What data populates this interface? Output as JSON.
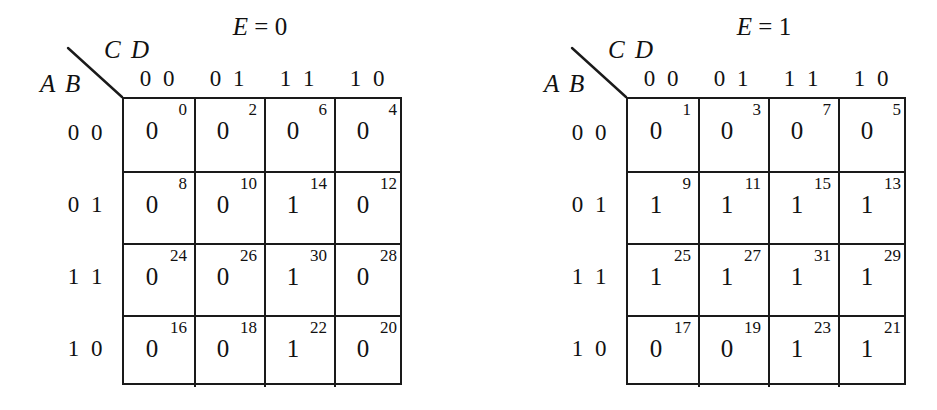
{
  "figure": {
    "type": "karnaugh-map-pair",
    "variables": [
      "A",
      "B",
      "C",
      "D",
      "E"
    ],
    "row_var_label": "A B",
    "col_var_label": "C D",
    "col_headers": [
      "0 0",
      "0 1",
      "1 1",
      "1 0"
    ],
    "row_headers": [
      "0 0",
      "0 1",
      "1 1",
      "1 0"
    ],
    "ink_color": "#1a1a1a",
    "background_color": "#ffffff"
  },
  "maps": [
    {
      "id": "map-e0",
      "title_var": "E",
      "title_rest": " = 0",
      "title_text": "E = 0",
      "e_value": "0",
      "rows": [
        {
          "label": "0 0",
          "cells": [
            {
              "index": "0",
              "value": "0"
            },
            {
              "index": "2",
              "value": "0"
            },
            {
              "index": "6",
              "value": "0"
            },
            {
              "index": "4",
              "value": "0"
            }
          ]
        },
        {
          "label": "0 1",
          "cells": [
            {
              "index": "8",
              "value": "0"
            },
            {
              "index": "10",
              "value": "0"
            },
            {
              "index": "14",
              "value": "1"
            },
            {
              "index": "12",
              "value": "0"
            }
          ]
        },
        {
          "label": "1 1",
          "cells": [
            {
              "index": "24",
              "value": "0"
            },
            {
              "index": "26",
              "value": "0"
            },
            {
              "index": "30",
              "value": "1"
            },
            {
              "index": "28",
              "value": "0"
            }
          ]
        },
        {
          "label": "1 0",
          "cells": [
            {
              "index": "16",
              "value": "0"
            },
            {
              "index": "18",
              "value": "0"
            },
            {
              "index": "22",
              "value": "1"
            },
            {
              "index": "20",
              "value": "0"
            }
          ]
        }
      ]
    },
    {
      "id": "map-e1",
      "title_var": "E",
      "title_rest": " = 1",
      "title_text": "E = 1",
      "e_value": "1",
      "rows": [
        {
          "label": "0 0",
          "cells": [
            {
              "index": "1",
              "value": "0"
            },
            {
              "index": "3",
              "value": "0"
            },
            {
              "index": "7",
              "value": "0"
            },
            {
              "index": "5",
              "value": "0"
            }
          ]
        },
        {
          "label": "0 1",
          "cells": [
            {
              "index": "9",
              "value": "1"
            },
            {
              "index": "11",
              "value": "1"
            },
            {
              "index": "15",
              "value": "1"
            },
            {
              "index": "13",
              "value": "1"
            }
          ]
        },
        {
          "label": "1 1",
          "cells": [
            {
              "index": "25",
              "value": "1"
            },
            {
              "index": "27",
              "value": "1"
            },
            {
              "index": "31",
              "value": "1"
            },
            {
              "index": "29",
              "value": "1"
            }
          ]
        },
        {
          "label": "1 0",
          "cells": [
            {
              "index": "17",
              "value": "0"
            },
            {
              "index": "19",
              "value": "0"
            },
            {
              "index": "23",
              "value": "1"
            },
            {
              "index": "21",
              "value": "1"
            }
          ]
        }
      ]
    }
  ]
}
